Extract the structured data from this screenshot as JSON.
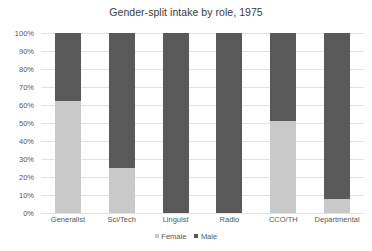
{
  "chart_data": {
    "type": "bar",
    "variant": "stacked-100-percent",
    "title": "Gender-split intake by role, 1975",
    "xlabel": "",
    "ylabel": "",
    "ylim": [
      0,
      100
    ],
    "ytick_labels": [
      "100%",
      "90%",
      "80%",
      "70%",
      "60%",
      "50%",
      "40%",
      "30%",
      "20%",
      "10%",
      "0%"
    ],
    "ytick_values": [
      100,
      90,
      80,
      70,
      60,
      50,
      40,
      30,
      20,
      10,
      0
    ],
    "grid": true,
    "legend_position": "bottom",
    "categories": [
      "Generalist",
      "Sci/Tech",
      "Linguist",
      "Radio",
      "CCO/TH",
      "Departmental"
    ],
    "series": [
      {
        "name": "Female",
        "color": "#c9c9c9",
        "values": [
          62,
          25,
          0,
          0,
          51,
          8
        ]
      },
      {
        "name": "Male",
        "color": "#595959",
        "values": [
          38,
          75,
          100,
          100,
          49,
          92
        ]
      }
    ]
  },
  "colors": {
    "background": "#ffffff",
    "gridline": "#e2e2e2",
    "tick_text": "#585858",
    "title_text": "#3b3b3b"
  }
}
